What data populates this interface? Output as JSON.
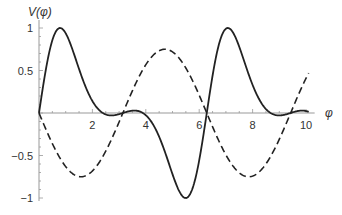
{
  "chart_data": {
    "type": "line",
    "title": "",
    "xlabel": "φ",
    "ylabel": "V(φ)",
    "xlim": [
      0,
      10.1
    ],
    "ylim": [
      -1,
      1
    ],
    "x_ticks": [
      2,
      4,
      6,
      8,
      10
    ],
    "x_tick_labels": [
      "2",
      "4",
      "6",
      "8",
      "10"
    ],
    "y_ticks": [
      -1,
      -0.5,
      0.5,
      1
    ],
    "y_tick_labels": [
      "−1",
      "−0.5",
      "0.5",
      "1"
    ],
    "grid": false,
    "legend": null,
    "series": [
      {
        "name": "solid",
        "style": "solid",
        "description": "skewed periodic curve, peaks ≈1 near φ≈0.8 and 7.1, troughs ≈−1 near φ≈5.5, zeros at 0, π, 2π, 3π",
        "x": [
          0,
          0.8,
          2,
          3.14,
          4.5,
          5.5,
          6.28,
          7.1,
          8.5,
          9.42,
          10.1
        ],
        "values": [
          0,
          1,
          0.72,
          0,
          -0.62,
          -1,
          0,
          1,
          0.58,
          0,
          -0.42
        ]
      },
      {
        "name": "dashed",
        "style": "dashed",
        "description": "≈ −0.75·sin φ",
        "x": [
          0,
          1.57,
          3.14,
          4.71,
          6.28,
          7.85,
          9.42,
          10.1
        ],
        "values": [
          0,
          -0.75,
          0,
          0.75,
          0,
          -0.75,
          0,
          0.47
        ]
      }
    ]
  },
  "labels": {
    "y_axis": "V(φ)",
    "x_axis": "φ"
  }
}
